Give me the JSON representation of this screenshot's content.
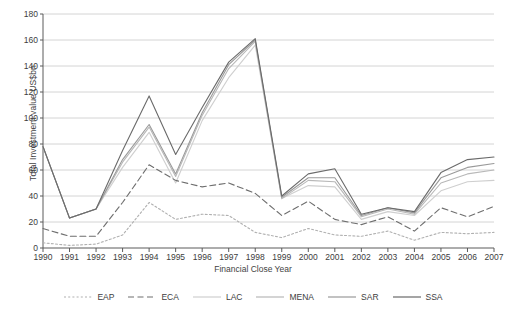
{
  "chart_data": {
    "type": "line",
    "title": "",
    "xlabel": "Financial Close Year",
    "ylabel": "Total Investment value US$bn",
    "categories": [
      1990,
      1991,
      1992,
      1993,
      1994,
      1995,
      1996,
      1997,
      1998,
      1999,
      2000,
      2001,
      2002,
      2003,
      2004,
      2005,
      2006,
      2007
    ],
    "x": [
      "1990",
      "1991",
      "1992",
      "1993",
      "1994",
      "1995",
      "1996",
      "1997",
      "1998",
      "1999",
      "2000",
      "2001",
      "2002",
      "2003",
      "2004",
      "2005",
      "2006",
      "2007"
    ],
    "ylim": [
      0,
      180
    ],
    "yticks": [
      0,
      20,
      40,
      60,
      80,
      100,
      120,
      140,
      160,
      180
    ],
    "ytick_labels": [
      "0",
      "20",
      "40",
      "60",
      "80",
      "100",
      "120",
      "140",
      "160",
      "180"
    ],
    "xlim": [
      1990,
      2007
    ],
    "grid": "horizontal",
    "legend_position": "bottom",
    "series": [
      {
        "name": "EAP",
        "style": "dotted",
        "color": "#b0b0b0",
        "values": [
          4,
          2,
          3,
          10,
          35,
          22,
          26,
          25,
          12,
          8,
          15,
          10,
          9,
          13,
          6,
          12,
          11,
          12
        ]
      },
      {
        "name": "ECA",
        "style": "dashed",
        "color": "#6e6e6e",
        "values": [
          15,
          9,
          9,
          35,
          64,
          52,
          47,
          50,
          42,
          25,
          36,
          22,
          18,
          24,
          13,
          31,
          24,
          32
        ]
      },
      {
        "name": "LAC",
        "style": "solid",
        "color": "#cfcfcf",
        "values": [
          78,
          23,
          30,
          62,
          89,
          50,
          98,
          131,
          156,
          38,
          48,
          47,
          22,
          28,
          25,
          44,
          51,
          52
        ]
      },
      {
        "name": "MENA",
        "style": "solid",
        "color": "#b8b8b8",
        "values": [
          78,
          23,
          30,
          66,
          93,
          55,
          102,
          138,
          159,
          38,
          52,
          51,
          24,
          30,
          26,
          50,
          57,
          60
        ]
      },
      {
        "name": "SAR",
        "style": "solid",
        "color": "#9a9a9a",
        "values": [
          78,
          23,
          30,
          68,
          95,
          57,
          104,
          141,
          160,
          39,
          54,
          54,
          25,
          31,
          27,
          54,
          62,
          65
        ]
      },
      {
        "name": "SSA",
        "style": "solid",
        "color": "#6a6a6a",
        "values": [
          78,
          23,
          30,
          75,
          117,
          72,
          108,
          143,
          161,
          40,
          57,
          61,
          26,
          31,
          28,
          58,
          68,
          70
        ]
      }
    ]
  },
  "legend": {
    "items": [
      {
        "label": "EAP"
      },
      {
        "label": "ECA"
      },
      {
        "label": "LAC"
      },
      {
        "label": "MENA"
      },
      {
        "label": "SAR"
      },
      {
        "label": "SSA"
      }
    ]
  }
}
